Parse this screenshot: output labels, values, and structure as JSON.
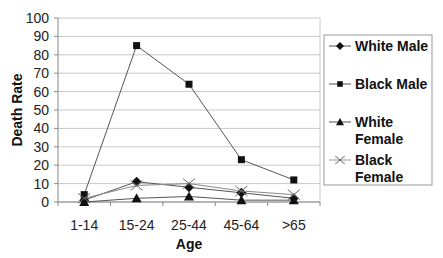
{
  "chart_data": {
    "type": "line",
    "title": "",
    "xlabel": "Age",
    "ylabel": "Death Rate",
    "categories": [
      "1-14",
      "15-24",
      "25-44",
      "45-64",
      ">65"
    ],
    "ylim": [
      0,
      100
    ],
    "yticks": [
      0,
      10,
      20,
      30,
      40,
      50,
      60,
      70,
      80,
      90,
      100
    ],
    "grid": true,
    "legend_position": "right",
    "series": [
      {
        "name": "White Male",
        "marker": "diamond",
        "values": [
          1,
          11,
          8,
          5,
          2
        ]
      },
      {
        "name": "Black Male",
        "marker": "square",
        "values": [
          4,
          85,
          64,
          23,
          12
        ]
      },
      {
        "name": "White Female",
        "marker": "triangle",
        "values": [
          0,
          2,
          3,
          1,
          1
        ]
      },
      {
        "name": "Black Female",
        "marker": "x",
        "values": [
          2,
          9,
          10,
          6,
          4
        ]
      }
    ]
  },
  "legend": {
    "items": [
      {
        "line1": "White Male",
        "line2": ""
      },
      {
        "line1": "Black Male",
        "line2": ""
      },
      {
        "line1": "White",
        "line2": "Female"
      },
      {
        "line1": "Black",
        "line2": "Female"
      }
    ]
  }
}
